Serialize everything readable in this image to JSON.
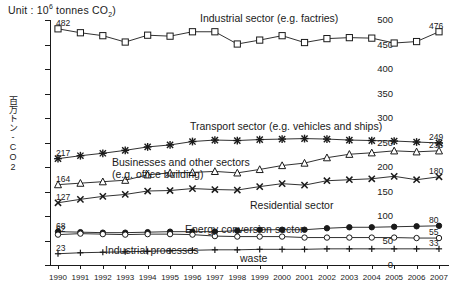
{
  "unit_label": {
    "prefix": "Unit : 10",
    "exponent": "6",
    "middle": " tonnes CO",
    "subscript": "2",
    "suffix": ")"
  },
  "yaxis_title": "百万トン-CO2",
  "chart_data": {
    "type": "line",
    "title": "",
    "xlabel": "",
    "ylabel": "百万トン-CO2",
    "unit": "10^6 tonnes CO2",
    "grid": false,
    "legend": "inline-annotations",
    "ylim": [
      0,
      500
    ],
    "yticks": [
      0,
      50,
      100,
      150,
      200,
      250,
      300,
      350,
      400,
      450,
      500
    ],
    "categories": [
      "1990",
      "1991",
      "1992",
      "1993",
      "1994",
      "1995",
      "1996",
      "1997",
      "1998",
      "1999",
      "2000",
      "2001",
      "2002",
      "2003",
      "2004",
      "2005",
      "2006",
      "2007"
    ],
    "series": [
      {
        "name": "Industrial sector (e.g. factries)",
        "marker": "square",
        "start_value": 482,
        "end_value": 476,
        "values": [
          482,
          474,
          468,
          455,
          469,
          467,
          476,
          476,
          451,
          459,
          468,
          454,
          462,
          464,
          463,
          453,
          456,
          476
        ]
      },
      {
        "name": "Transport sector (e.g. vehicles and ships)",
        "marker": "star",
        "start_value": 217,
        "end_value": 249,
        "values": [
          217,
          223,
          228,
          234,
          241,
          245,
          252,
          255,
          254,
          256,
          257,
          258,
          257,
          255,
          254,
          253,
          251,
          249
        ]
      },
      {
        "name": "Businesses and other sectors (e.g. office building)",
        "marker": "triangle",
        "start_value": 164,
        "end_value": 233,
        "values": [
          164,
          167,
          170,
          173,
          184,
          188,
          189,
          191,
          188,
          195,
          203,
          208,
          219,
          226,
          229,
          233,
          231,
          233
        ]
      },
      {
        "name": "Residential sector",
        "marker": "cross",
        "start_value": 127,
        "end_value": 180,
        "values": [
          127,
          134,
          140,
          144,
          151,
          152,
          156,
          154,
          153,
          160,
          166,
          163,
          172,
          174,
          176,
          181,
          174,
          180
        ]
      },
      {
        "name": "Energy conversion sector",
        "marker": "filled-circle",
        "start_value": 68,
        "end_value": 80,
        "values": [
          68,
          67,
          66,
          66,
          67,
          68,
          68,
          68,
          70,
          72,
          72,
          72,
          75,
          77,
          77,
          78,
          79,
          80
        ]
      },
      {
        "name": "Industrial processes",
        "marker": "open-circle",
        "start_value": 62,
        "end_value": 55,
        "values": [
          62,
          64,
          63,
          62,
          63,
          63,
          62,
          59,
          58,
          58,
          58,
          56,
          56,
          56,
          56,
          56,
          55,
          55
        ]
      },
      {
        "name": "waste",
        "marker": "plus",
        "start_value": 23,
        "end_value": 33,
        "values": [
          23,
          25,
          26,
          27,
          28,
          29,
          30,
          31,
          31,
          32,
          32,
          32,
          33,
          33,
          33,
          33,
          33,
          33
        ]
      }
    ],
    "annotations": [
      {
        "text": "Industrial sector (e.g. factries)",
        "series": 0
      },
      {
        "text": "Transport sector (e.g. vehicles and ships)",
        "series": 1
      },
      {
        "text": "Businesses and other sectors (e.g. office building)",
        "series": 2
      },
      {
        "text": "Residential sector",
        "series": 3
      },
      {
        "text": "Energy conversion sector",
        "series": 4
      },
      {
        "text": "Industrial processes",
        "series": 5
      },
      {
        "text": "waste",
        "series": 6
      }
    ],
    "endpoint_labels": {
      "left": [
        482,
        217,
        164,
        127,
        68,
        62,
        23
      ],
      "right": [
        476,
        249,
        233,
        180,
        80,
        55,
        33
      ]
    }
  },
  "annotation_text": {
    "industrial": "Industrial sector (e.g. factries)",
    "transport": "Transport sector (e.g. vehicles and ships)",
    "business_line1": "Businesses and other",
    "business_line2": "sectors (e.g. office building)",
    "residential": "Residential sector",
    "energy": "Energy conversion sector",
    "processes": "Industrial processes",
    "waste": "waste"
  },
  "endpoints": {
    "ind_left": "482",
    "ind_right": "476",
    "tra_left": "217",
    "tra_right": "249",
    "bus_left": "164",
    "bus_right": "233",
    "res_left": "127",
    "res_right": "180",
    "ene_left": "68",
    "ene_right": "80",
    "pro_left": "62",
    "pro_right": "55",
    "was_left": "23",
    "was_right": "33"
  }
}
